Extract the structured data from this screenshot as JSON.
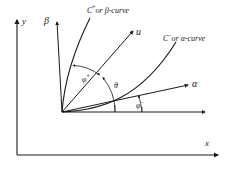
{
  "figure": {
    "axes": {
      "y_label": "y",
      "x_label": "x"
    },
    "rays": [
      {
        "id": "beta",
        "label": "β"
      },
      {
        "id": "u",
        "label": "u"
      },
      {
        "id": "alpha",
        "label": "α"
      }
    ],
    "curves": [
      {
        "id": "beta-curve",
        "prefix": "C",
        "sign": "+",
        "text": "or β-curve"
      },
      {
        "id": "alpha-curve",
        "prefix": "C",
        "sign": "−",
        "text": "or α-curve"
      }
    ],
    "angles": [
      {
        "id": "phi-plus",
        "symbol": "φ",
        "sign": "+"
      },
      {
        "id": "theta",
        "symbol": "θ",
        "sign": ""
      },
      {
        "id": "phi-minus",
        "symbol": "φ",
        "sign": "−"
      }
    ],
    "colors": {
      "ink": "#1a1a1a",
      "background": "#ffffff"
    }
  }
}
